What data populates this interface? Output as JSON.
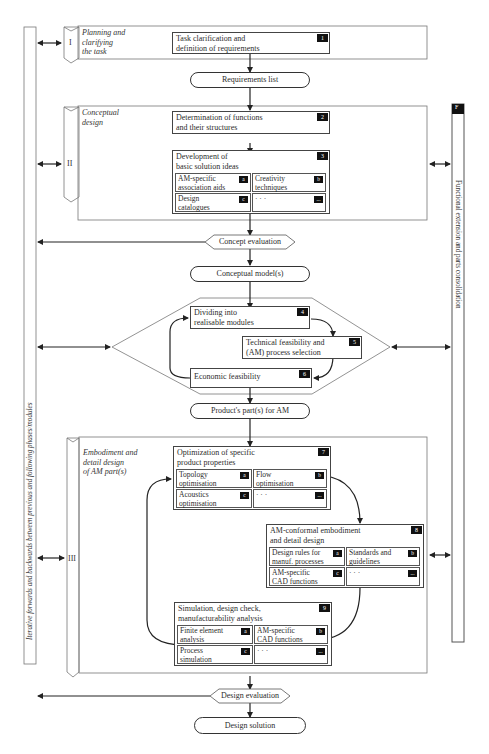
{
  "side_bars": {
    "left_label": "Iterative forwards and backwards between previous and following phases/modules",
    "right_label": "Functional extension and parts consolidation",
    "right_badge": "F"
  },
  "phases": [
    {
      "numeral": "I",
      "title": "Planning and clarifying the task",
      "title_lines": [
        "Planning and",
        "clarifying",
        "the task"
      ]
    },
    {
      "numeral": "II",
      "title": "Conceptual design",
      "title_lines": [
        "Conceptual",
        "design"
      ]
    },
    {
      "numeral": "III",
      "title": "Embodiment and detail design of AM part(s)",
      "title_lines": [
        "Embodiment and",
        "detail design",
        "of AM part(s)"
      ]
    }
  ],
  "steps": {
    "s1": {
      "badge": "1",
      "lines": [
        "Task clarification and",
        "definition of requirements"
      ]
    },
    "s2": {
      "badge": "2",
      "lines": [
        "Determination of functions",
        "and their structures"
      ]
    },
    "s3": {
      "badge": "3",
      "lines": [
        "Development of",
        "basic solution ideas"
      ],
      "subs": [
        {
          "badge": "a",
          "lines": [
            "AM-specific",
            "association aids"
          ]
        },
        {
          "badge": "b",
          "lines": [
            "Creativity",
            "techniques"
          ]
        },
        {
          "badge": "c",
          "lines": [
            "Design",
            "catalogues"
          ]
        },
        {
          "badge": "...",
          "lines": [
            "· · ·",
            ""
          ]
        }
      ]
    },
    "s4": {
      "badge": "4",
      "lines": [
        "Dividing into",
        "realisable modules"
      ]
    },
    "s5": {
      "badge": "5",
      "lines": [
        "Technical feasibility and",
        "(AM) process selection"
      ]
    },
    "s6": {
      "badge": "6",
      "lines": [
        "Economic feasibility",
        ""
      ]
    },
    "s7": {
      "badge": "7",
      "lines": [
        "Optimization of specific",
        "product properties"
      ],
      "subs": [
        {
          "badge": "a",
          "lines": [
            "Topology",
            "optimisation"
          ]
        },
        {
          "badge": "b",
          "lines": [
            "Flow",
            "optimisation"
          ]
        },
        {
          "badge": "c",
          "lines": [
            "Acoustics",
            "optimisation"
          ]
        },
        {
          "badge": "...",
          "lines": [
            "· · ·",
            ""
          ]
        }
      ]
    },
    "s8": {
      "badge": "8",
      "lines": [
        "AM-conformal embodiment",
        "and detail design"
      ],
      "subs": [
        {
          "badge": "a",
          "lines": [
            "Design rules for",
            "manuf. processes"
          ]
        },
        {
          "badge": "b",
          "lines": [
            "Standards and",
            "guidelines"
          ]
        },
        {
          "badge": "c",
          "lines": [
            "AM-specific",
            "CAD functions"
          ]
        },
        {
          "badge": "...",
          "lines": [
            "· · ·",
            ""
          ]
        }
      ]
    },
    "s9": {
      "badge": "9",
      "lines": [
        "Simulation, design check,",
        "manufacturability analysis"
      ],
      "subs": [
        {
          "badge": "a",
          "lines": [
            "Finite element",
            "analysis"
          ]
        },
        {
          "badge": "b",
          "lines": [
            "AM-specific",
            "CAD functions"
          ]
        },
        {
          "badge": "c",
          "lines": [
            "Process",
            "simulation"
          ]
        },
        {
          "badge": "...",
          "lines": [
            "· · ·",
            ""
          ]
        }
      ]
    }
  },
  "outputs": {
    "requirements_list": "Requirements list",
    "concept_evaluation": "Concept evaluation",
    "conceptual_models": "Conceptual model(s)",
    "products_parts": "Product's part(s) for AM",
    "design_evaluation": "Design evaluation",
    "design_solution": "Design solution"
  }
}
